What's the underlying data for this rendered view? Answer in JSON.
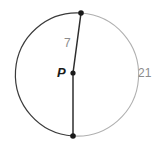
{
  "figure": {
    "type": "circle-diagram",
    "background_color": "#ffffff",
    "width": 162,
    "height": 150,
    "circle": {
      "center_label": "P",
      "center_x": 71,
      "center_y": 73,
      "radius": 60.5,
      "major_arc_color": "#3b3b3b",
      "minor_arc_color": "#b0b0b0",
      "stroke_width": 1.1
    },
    "center_point": {
      "name": "P",
      "x": 73,
      "y": 73,
      "color": "#1a1a1a",
      "radius": 2.6
    },
    "segments": [
      {
        "name": "radius-upper",
        "label": "7",
        "from_x": 73,
        "from_y": 73,
        "to_x": 81,
        "to_y": 13,
        "color": "#2e2e2e",
        "stroke_width": 1.5
      },
      {
        "name": "radius-lower",
        "label": "",
        "from_x": 73,
        "from_y": 73,
        "to_x": 73,
        "to_y": 136,
        "color": "#2e2e2e",
        "stroke_width": 1.5
      }
    ],
    "endpoints": [
      {
        "name": "top-point",
        "x": 81,
        "y": 13,
        "color": "#1a1a1a",
        "radius": 2.8
      },
      {
        "name": "bottom-point",
        "x": 73,
        "y": 136,
        "color": "#1a1a1a",
        "radius": 2.8
      }
    ],
    "labels": {
      "center": "P",
      "radius_measure": "7",
      "arc_measure": "21"
    }
  }
}
